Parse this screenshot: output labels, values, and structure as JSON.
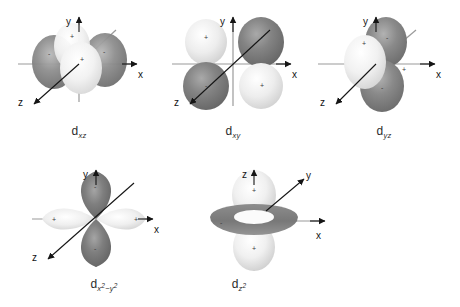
{
  "figure": {
    "background_color": "#ffffff",
    "dark_lobe_color": "#7d7d7d",
    "light_lobe_color": "#efefef",
    "axis_color": "#8c8c8c",
    "axis_arrow_color": "#1a1a1a",
    "label_color": "#2b2b2b"
  },
  "orbitals": [
    {
      "id": "dxz",
      "name": "d-xz-orbital",
      "label_base": "d",
      "label_sub": "xz",
      "axes": {
        "vertical": "y",
        "horizontal": "x",
        "diagonal_front": "z"
      },
      "lobe_signs": [
        "+",
        "-",
        "+",
        "-"
      ],
      "description": "four lobes between x and z axes, viewed nearly edge-on"
    },
    {
      "id": "dxy",
      "name": "d-xy-orbital",
      "label_base": "d",
      "label_sub": "xy",
      "axes": {
        "vertical": "y",
        "horizontal": "x",
        "diagonal_front": "z"
      },
      "lobe_signs": [
        "+",
        "-",
        "-",
        "+"
      ],
      "description": "four lobes in the quadrants between x and y axes"
    },
    {
      "id": "dyz",
      "name": "d-yz-orbital",
      "label_base": "d",
      "label_sub": "yz",
      "axes": {
        "vertical": "y",
        "horizontal": "x",
        "diagonal_front": "z"
      },
      "lobe_signs": [
        "+",
        "-",
        "-",
        "+"
      ],
      "description": "four lobes between y and z axes, viewed nearly edge-on"
    },
    {
      "id": "dx2-y2",
      "name": "d-x2-y2-orbital",
      "label_base": "d",
      "label_sub_x": "x",
      "label_sup_x": "2",
      "label_minus": "−",
      "label_sub_y": "y",
      "label_sup_y": "2",
      "axes": {
        "vertical": "y",
        "horizontal": "x",
        "diagonal_front": "z"
      },
      "lobe_signs": [
        "+",
        "-",
        "+",
        "-"
      ],
      "description": "four lobes lying along the x and y axes"
    },
    {
      "id": "dz2",
      "name": "d-z2-orbital",
      "label_base": "d",
      "label_sub_z": "z",
      "label_sup_z": "2",
      "axes": {
        "vertical": "z",
        "diagonal_back": "y",
        "horizontal": "x"
      },
      "lobe_signs": [
        "+",
        "+",
        "-"
      ],
      "description": "two lobes along z axis with a doughnut torus in the xy plane"
    }
  ]
}
